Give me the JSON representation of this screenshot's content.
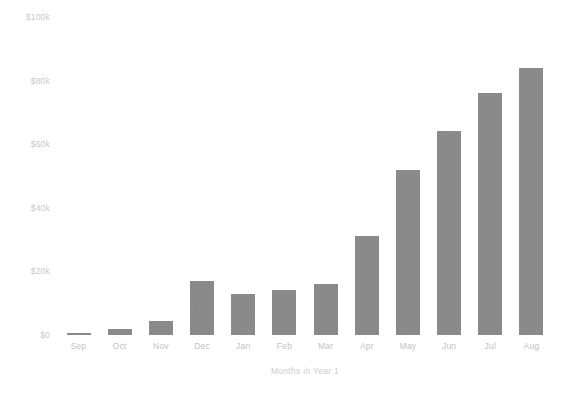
{
  "chart_data": {
    "type": "bar",
    "title": "",
    "subtitle": "",
    "xlabel": "Months in Year 1",
    "ylabel": "",
    "categories": [
      "Sep",
      "Oct",
      "Nov",
      "Dec",
      "Jan",
      "Feb",
      "Mar",
      "Apr",
      "May",
      "Jun",
      "Jul",
      "Aug"
    ],
    "values": [
      500,
      2000,
      4500,
      17000,
      13000,
      14000,
      16000,
      31000,
      52000,
      64000,
      76000,
      84000
    ],
    "value_unit": "USD",
    "ylim": [
      0,
      100000
    ],
    "y_tick_values": [
      0,
      20000,
      40000,
      60000,
      80000,
      100000
    ],
    "y_tick_labels": [
      "$0",
      "$20k",
      "$40k",
      "$60k",
      "$80k",
      "$100k"
    ],
    "grid": false,
    "legend": false,
    "legend_position": "none",
    "series": [
      {
        "name": "Revenue",
        "values": [
          500,
          2000,
          4500,
          17000,
          13000,
          14000,
          16000,
          31000,
          52000,
          64000,
          76000,
          84000
        ]
      }
    ],
    "bar_color": "#8c8c8c",
    "axis_text_color": "#c6c6c6",
    "background_color": "#ffffff"
  }
}
